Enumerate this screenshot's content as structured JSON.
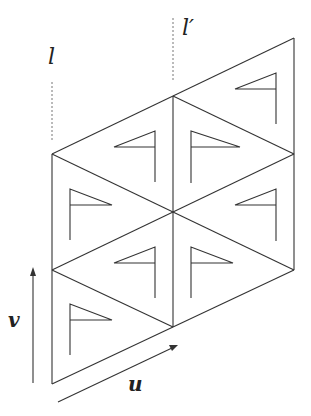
{
  "figure": {
    "labels": {
      "line_l": "l",
      "line_l_prime": "l′",
      "vector_u": "u",
      "vector_v": "v"
    },
    "colors": {
      "stroke": "#333333",
      "dashed": "#777777",
      "background": "#ffffff"
    },
    "lattice": {
      "columns_x": [
        52,
        173,
        294
      ],
      "column_vertices_y": {
        "left": [
          154,
          270,
          386
        ],
        "middle": [
          96,
          212,
          328
        ],
        "right": [
          38,
          154,
          270
        ]
      }
    },
    "flags": [
      {
        "triangle": "left-col-upper-half",
        "dir": "right",
        "pole_x": 70,
        "top": 189,
        "bottom": 240,
        "tip_x": 112
      },
      {
        "triangle": "left-col-lower-half",
        "dir": "right",
        "pole_x": 70,
        "top": 304,
        "bottom": 355,
        "tip_x": 112
      },
      {
        "triangle": "mid-left-upper",
        "dir": "left",
        "pole_x": 155,
        "top": 131,
        "bottom": 182,
        "tip_x": 114
      },
      {
        "triangle": "mid-left-lower",
        "dir": "left",
        "pole_x": 155,
        "top": 246,
        "bottom": 297,
        "tip_x": 114
      },
      {
        "triangle": "mid-right-upper",
        "dir": "right",
        "pole_x": 191,
        "top": 131,
        "bottom": 182,
        "tip_x": 240
      },
      {
        "triangle": "mid-right-lower",
        "dir": "right",
        "pole_x": 191,
        "top": 246,
        "bottom": 297,
        "tip_x": 233
      },
      {
        "triangle": "right-col-upper",
        "dir": "left",
        "pole_x": 276,
        "top": 73,
        "bottom": 124,
        "tip_x": 235
      },
      {
        "triangle": "right-col-lower",
        "dir": "left",
        "pole_x": 276,
        "top": 188,
        "bottom": 240,
        "tip_x": 235
      }
    ]
  }
}
